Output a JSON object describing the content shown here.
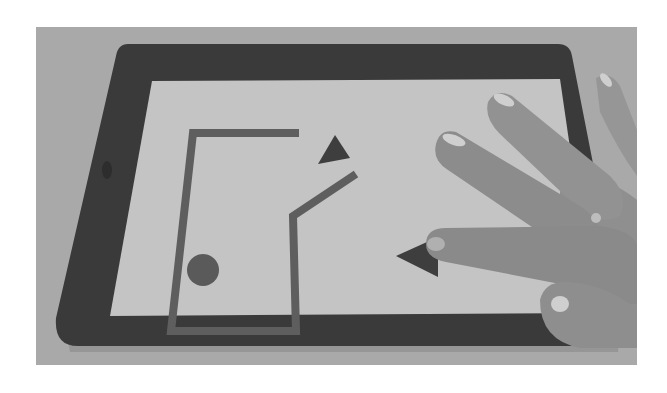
{
  "scene": {
    "description": "Grayscale photo of a hand touching a tablet displaying a simple line-drawn game/puzzle scene",
    "colors": {
      "background_surface": "#a9a9a9",
      "canvas": "#ffffff",
      "bezel": "#3a3a3a",
      "screen": "#c4c4c4",
      "shape": "#5e5e5e",
      "triangle": "#3e3e3e",
      "skin": "#8f8f8f",
      "skin_light": "#a3a3a3",
      "nail": "#cfcfcf"
    }
  },
  "tablet": {
    "screen_shapes": {
      "enclosure_path": "M 259 102 L 193 102 L 176 256 L 289 256 L 295 150 L 356 118",
      "circle": {
        "cx": 203,
        "cy": 211,
        "r": 15
      },
      "triangle_top": "317,111 349,127 322,134",
      "triangle_right": "396,202 438,184 438,223"
    }
  }
}
